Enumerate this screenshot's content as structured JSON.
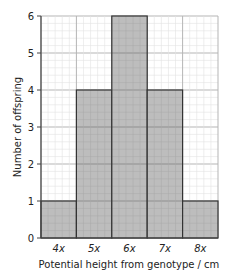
{
  "chart_data": {
    "type": "bar",
    "title": "",
    "xlabel": "Potential height from genotype / cm",
    "ylabel": "Number of offspring",
    "categories": [
      "4x",
      "5x",
      "6x",
      "7x",
      "8x"
    ],
    "values": [
      1,
      4,
      6,
      4,
      1
    ],
    "ylim": [
      0,
      6
    ],
    "yticks": [
      0,
      1,
      2,
      3,
      4,
      5,
      6
    ],
    "grid": true,
    "bar_color": "#bdbdbd",
    "legend": null
  }
}
